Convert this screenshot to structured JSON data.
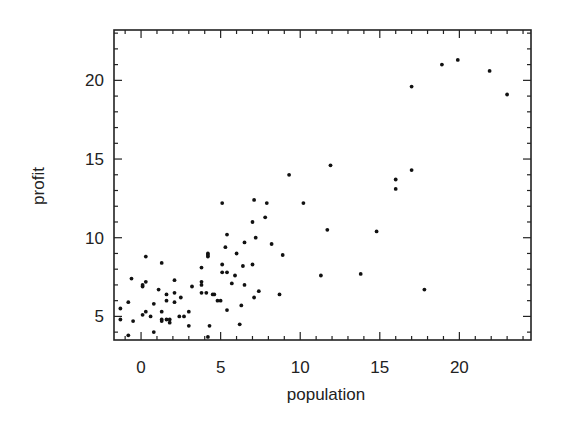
{
  "chart_data": {
    "type": "scatter",
    "title": "",
    "xlabel": "population",
    "ylabel": "profit",
    "xlim": [
      -1.7,
      24.5
    ],
    "ylim": [
      3.5,
      23.2
    ],
    "xticks": [
      0,
      5,
      10,
      15,
      20
    ],
    "yticks": [
      5,
      10,
      15,
      20
    ],
    "x_minor_step": 1,
    "y_minor_step": 1,
    "grid": false,
    "legend": null,
    "marker_color": "#111111",
    "frame_color": "#222222",
    "series": [
      {
        "name": "data",
        "points": [
          [
            0.3,
            8.8
          ],
          [
            1.3,
            8.4
          ],
          [
            -0.6,
            7.4
          ],
          [
            0.3,
            7.2
          ],
          [
            0.1,
            7.0
          ],
          [
            0.1,
            6.9
          ],
          [
            2.1,
            7.3
          ],
          [
            1.1,
            6.7
          ],
          [
            3.2,
            6.9
          ],
          [
            3.8,
            7.2
          ],
          [
            3.8,
            7.0
          ],
          [
            4.2,
            8.9
          ],
          [
            4.2,
            8.8
          ],
          [
            3.8,
            8.1
          ],
          [
            1.6,
            6.4
          ],
          [
            2.1,
            6.5
          ],
          [
            1.6,
            6.0
          ],
          [
            2.1,
            5.9
          ],
          [
            2.5,
            6.2
          ],
          [
            3.8,
            6.5
          ],
          [
            4.1,
            6.5
          ],
          [
            4.5,
            6.4
          ],
          [
            -0.8,
            5.9
          ],
          [
            0.8,
            5.8
          ],
          [
            -1.3,
            5.5
          ],
          [
            1.3,
            5.3
          ],
          [
            3.0,
            5.3
          ],
          [
            0.3,
            5.3
          ],
          [
            0.1,
            5.1
          ],
          [
            0.6,
            5.0
          ],
          [
            2.7,
            5.0
          ],
          [
            2.4,
            5.0
          ],
          [
            -1.3,
            4.8
          ],
          [
            -0.5,
            4.7
          ],
          [
            1.3,
            4.8
          ],
          [
            1.6,
            4.8
          ],
          [
            1.8,
            4.8
          ],
          [
            1.3,
            4.7
          ],
          [
            1.8,
            4.6
          ],
          [
            4.3,
            4.4
          ],
          [
            0.8,
            4.0
          ],
          [
            3.0,
            4.4
          ],
          [
            -0.8,
            3.8
          ],
          [
            4.2,
            3.7
          ],
          [
            5.1,
            12.2
          ],
          [
            7.1,
            12.4
          ],
          [
            7.9,
            12.2
          ],
          [
            7.0,
            11.0
          ],
          [
            7.8,
            11.3
          ],
          [
            5.4,
            10.2
          ],
          [
            7.2,
            10.0
          ],
          [
            6.5,
            9.7
          ],
          [
            8.2,
            9.6
          ],
          [
            5.3,
            9.4
          ],
          [
            4.2,
            9.0
          ],
          [
            6.0,
            9.0
          ],
          [
            8.9,
            8.9
          ],
          [
            5.1,
            8.3
          ],
          [
            7.0,
            8.3
          ],
          [
            6.4,
            8.2
          ],
          [
            5.1,
            7.8
          ],
          [
            5.4,
            7.8
          ],
          [
            5.9,
            7.6
          ],
          [
            5.7,
            7.1
          ],
          [
            6.5,
            7.0
          ],
          [
            4.6,
            6.4
          ],
          [
            4.8,
            6.0
          ],
          [
            5.0,
            6.0
          ],
          [
            7.4,
            6.6
          ],
          [
            7.1,
            6.2
          ],
          [
            8.7,
            6.4
          ],
          [
            6.3,
            5.7
          ],
          [
            5.4,
            5.4
          ],
          [
            6.2,
            4.5
          ],
          [
            11.9,
            14.6
          ],
          [
            9.3,
            14.0
          ],
          [
            17.0,
            14.3
          ],
          [
            16.0,
            13.7
          ],
          [
            16.0,
            13.1
          ],
          [
            10.2,
            12.2
          ],
          [
            11.7,
            10.5
          ],
          [
            14.8,
            10.4
          ],
          [
            11.3,
            7.6
          ],
          [
            13.8,
            7.7
          ],
          [
            17.8,
            6.7
          ],
          [
            18.9,
            21.0
          ],
          [
            19.9,
            21.3
          ],
          [
            21.9,
            20.6
          ],
          [
            17.0,
            19.6
          ],
          [
            23.0,
            19.1
          ]
        ]
      }
    ]
  },
  "axes": {
    "x_title": "population",
    "y_title": "profit",
    "x_tick_labels": [
      "0",
      "5",
      "10",
      "15",
      "20"
    ],
    "y_tick_labels": [
      "5",
      "10",
      "15",
      "20"
    ]
  }
}
